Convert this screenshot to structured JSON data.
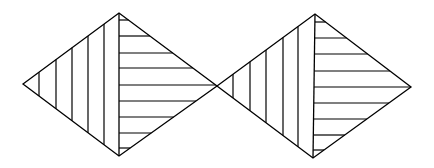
{
  "figure": {
    "background": "#ffffff",
    "stroke_color": "#000000",
    "shapes": [
      {
        "name": "left-diamond",
        "vertices": {
          "left": [
            23,
            84
          ],
          "top": [
            119,
            13
          ],
          "right": [
            217,
            86
          ],
          "bottom": [
            119,
            156
          ]
        },
        "left_half_hatching": {
          "orientation": "vertical",
          "x_positions": [
            39,
            56,
            72,
            88,
            104
          ]
        },
        "right_half_hatching": {
          "orientation": "horizontal",
          "y_positions": [
            20,
            36,
            53,
            68,
            85,
            101,
            117,
            133,
            148
          ]
        }
      },
      {
        "name": "right-diamond",
        "vertices": {
          "left": [
            217,
            86
          ],
          "top": [
            315,
            14
          ],
          "right": [
            411,
            87
          ],
          "bottom": [
            313,
            158
          ]
        },
        "left_half_hatching": {
          "orientation": "vertical",
          "x_positions": [
            233,
            250,
            266,
            283,
            298
          ]
        },
        "right_half_hatching": {
          "orientation": "horizontal",
          "y_positions": [
            22,
            38,
            54,
            71,
            87,
            103,
            119,
            135,
            150
          ]
        }
      }
    ]
  }
}
